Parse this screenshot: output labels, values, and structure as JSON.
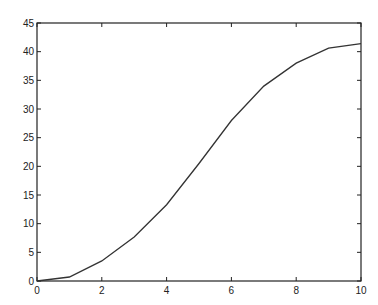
{
  "chart_data": {
    "type": "line",
    "title": "",
    "xlabel": "",
    "ylabel": "",
    "xlim": [
      0,
      10
    ],
    "ylim": [
      0,
      45
    ],
    "grid": false,
    "legend": null,
    "x": [
      0,
      1,
      2,
      3,
      4,
      5,
      6,
      7,
      8,
      9,
      10
    ],
    "series": [
      {
        "name": "series-1",
        "values": [
          0,
          0.7,
          3.5,
          7.7,
          13.3,
          20.5,
          28.0,
          34.0,
          38.0,
          40.6,
          41.4
        ],
        "color": "#333333"
      }
    ],
    "xticks": [
      0,
      2,
      4,
      6,
      8,
      10
    ],
    "xtick_labels": [
      "0",
      "2",
      "4",
      "6",
      "8",
      "10"
    ],
    "yticks": [
      0,
      5,
      10,
      15,
      20,
      25,
      30,
      35,
      40,
      45
    ],
    "ytick_labels": [
      "0",
      "5",
      "10",
      "15",
      "20",
      "25",
      "30",
      "35",
      "40",
      "45"
    ]
  },
  "style": {
    "axis_color": "#222222",
    "line_color": "#333333",
    "background": "#ffffff"
  }
}
